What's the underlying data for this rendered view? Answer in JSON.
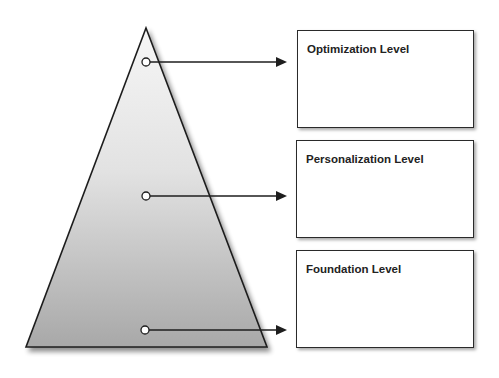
{
  "diagram": {
    "type": "pyramid",
    "levels": [
      {
        "id": "optimization",
        "label": "Optimization Level",
        "position": "top"
      },
      {
        "id": "personalization",
        "label": "Personalization Level",
        "position": "middle"
      },
      {
        "id": "foundation",
        "label": "Foundation Level",
        "position": "bottom"
      }
    ],
    "colors": {
      "pyramid_top": "#f4f4f4",
      "pyramid_bottom": "#a9a9a9",
      "stroke": "#1e1e1e"
    }
  }
}
